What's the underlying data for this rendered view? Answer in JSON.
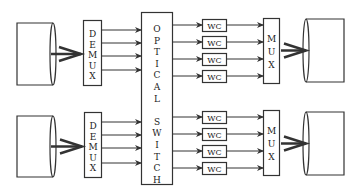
{
  "diagram": {
    "title": "",
    "colors": {
      "stroke": "#333333",
      "background": "#ffffff",
      "text": "#222222"
    },
    "switch": {
      "label_letters": [
        "O",
        "P",
        "T",
        "I",
        "C",
        "A",
        "L",
        "",
        "S",
        "W",
        "I",
        "T",
        "C",
        "H"
      ],
      "label": "OPTICAL SWITCH"
    },
    "groups": [
      {
        "demux": {
          "label": "DEMUX",
          "letters": [
            "D",
            "E",
            "M",
            "U",
            "X"
          ]
        },
        "mux": {
          "label": "MUX",
          "letters": [
            "M",
            "U",
            "X"
          ]
        },
        "wc": [
          "WC",
          "WC",
          "WC",
          "WC"
        ]
      },
      {
        "demux": {
          "label": "DEMUX",
          "letters": [
            "D",
            "E",
            "M",
            "U",
            "X"
          ]
        },
        "mux": {
          "label": "MUX",
          "letters": [
            "M",
            "U",
            "X"
          ]
        },
        "wc": [
          "WC",
          "WC",
          "WC",
          "WC"
        ]
      }
    ]
  }
}
